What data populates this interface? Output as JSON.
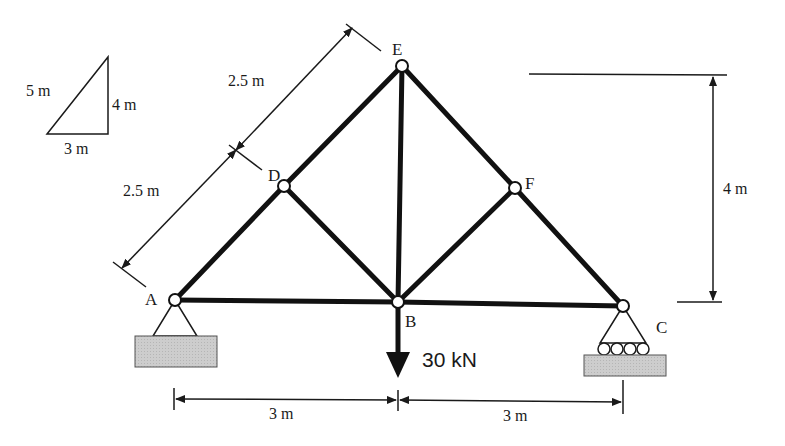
{
  "diagram": {
    "type": "truss",
    "colors": {
      "member": "#111111",
      "ground": "#c8c8c8",
      "line": "#1a1a1a",
      "background": "#ffffff"
    },
    "nodes": [
      {
        "id": "A",
        "label": "A",
        "x": 0,
        "y": 0
      },
      {
        "id": "B",
        "label": "B",
        "x": 3,
        "y": 0
      },
      {
        "id": "C",
        "label": "C",
        "x": 6,
        "y": 0
      },
      {
        "id": "D",
        "label": "D",
        "x": 1.5,
        "y": 2
      },
      {
        "id": "E",
        "label": "E",
        "x": 3,
        "y": 4
      },
      {
        "id": "F",
        "label": "F",
        "x": 4.5,
        "y": 2
      }
    ],
    "members": [
      "AB",
      "BC",
      "AD",
      "DE",
      "EF",
      "FC",
      "DB",
      "EB",
      "FB"
    ],
    "supports": [
      {
        "node": "A",
        "type": "pin"
      },
      {
        "node": "C",
        "type": "roller"
      }
    ],
    "load": {
      "node": "B",
      "label": "30 kN",
      "direction": "down"
    },
    "dimensions": {
      "slope_upper": "2.5 m",
      "slope_lower": "2.5 m",
      "height": "4 m",
      "span_left": "3 m",
      "span_right": "3 m"
    },
    "slope_triangle": {
      "hyp": "5 m",
      "vertical": "4 m",
      "horizontal": "3 m"
    }
  }
}
